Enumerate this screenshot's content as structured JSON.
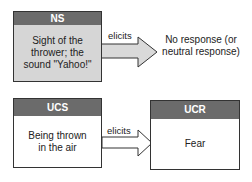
{
  "top_row": {
    "stimulus": {
      "header": "NS",
      "text": "Sight of the thrower; the sound \"Yahoo!\""
    },
    "arrow_label": "elicits",
    "response": {
      "text": "No response (or neutral response)"
    }
  },
  "bottom_row": {
    "stimulus": {
      "header": "UCS",
      "text": "Being thrown in the air"
    },
    "arrow_label": "elicits",
    "response": {
      "header": "UCR",
      "text": "Fear"
    }
  },
  "colors": {
    "header_bg": "#6b6b6b",
    "ns_body_bg": "#d6d6d6",
    "arrow_fill": "#d9d9d9",
    "border": "#333333"
  }
}
